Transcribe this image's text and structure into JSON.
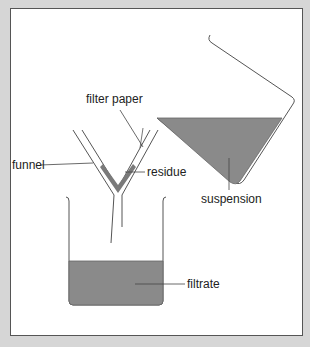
{
  "diagram": {
    "labels": {
      "filter_paper": "filter paper",
      "funnel": "funnel",
      "residue": "residue",
      "suspension": "suspension",
      "filtrate": "filtrate"
    },
    "colors": {
      "background": "#d6d6d6",
      "panel": "#ffffff",
      "liquid": "#8a8a8a",
      "line": "#444444"
    }
  }
}
